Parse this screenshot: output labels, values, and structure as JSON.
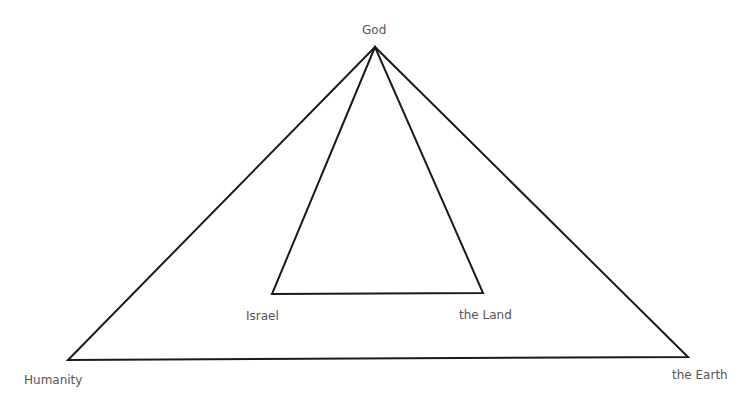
{
  "diagram": {
    "type": "nested-triangles",
    "colors": {
      "stroke": "#1a1a1a",
      "label": "#555555",
      "background": "#ffffff"
    },
    "nodes": {
      "god": {
        "label": "God",
        "x": 375,
        "y": 47
      },
      "humanity": {
        "label": "Humanity",
        "x": 68,
        "y": 360
      },
      "earth": {
        "label": "the Earth",
        "x": 688,
        "y": 357
      },
      "israel": {
        "label": "Israel",
        "x": 272,
        "y": 294
      },
      "land": {
        "label": "the Land",
        "x": 483,
        "y": 293
      }
    },
    "triangles": [
      {
        "name": "outer",
        "vertices": [
          "god",
          "humanity",
          "earth"
        ]
      },
      {
        "name": "inner",
        "vertices": [
          "god",
          "israel",
          "land"
        ]
      }
    ]
  }
}
